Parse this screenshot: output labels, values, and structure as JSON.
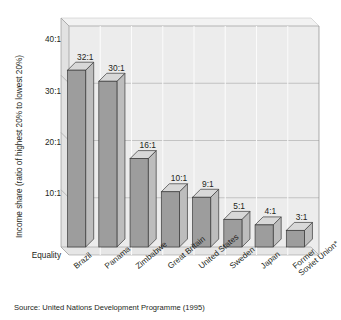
{
  "figure": {
    "title_sliver": "···························",
    "source_note": "Source: United Nations Development Programme (1995)"
  },
  "chart_data": {
    "type": "bar",
    "title": "",
    "xlabel": "",
    "ylabel": "Income share (ratio of highest 20% to lowest 20%)",
    "categories": [
      "Brazil",
      "Panama",
      "Zimbabwe",
      "Great Britain",
      "United States",
      "Sweden",
      "Japan",
      "Former Soviet Union*"
    ],
    "category_lines": [
      [
        "Brazil"
      ],
      [
        "Panama"
      ],
      [
        "Zimbabwe"
      ],
      [
        "Great Britain"
      ],
      [
        "United States"
      ],
      [
        "Sweden"
      ],
      [
        "Japan"
      ],
      [
        "Former",
        "Soviet Union*"
      ]
    ],
    "values": [
      32,
      30,
      16,
      10,
      9,
      5,
      4,
      3
    ],
    "value_labels": [
      "32:1",
      "30:1",
      "16:1",
      "10:1",
      "9:1",
      "5:1",
      "4:1",
      "3:1"
    ],
    "ylim": [
      0,
      40
    ],
    "ytick_values": [
      40,
      30,
      20,
      10,
      0
    ],
    "ytick_labels": [
      "40:1",
      "30:1",
      "20:1",
      "10:1",
      "Equality"
    ],
    "grid": true,
    "legend": "none",
    "style": "3d-column",
    "colors": {
      "plot_background": "#ececec",
      "gridline": "#ffffff",
      "bar_front": "#9d9d9d",
      "bar_top": "#d8d8d8",
      "bar_side": "#bdbdbd",
      "bar_edge": "#3a3a3a",
      "wall_left": "#e2e2e2",
      "floor": "#e6e6e6",
      "axis": "#4a4a4a",
      "text": "#231f20"
    }
  }
}
